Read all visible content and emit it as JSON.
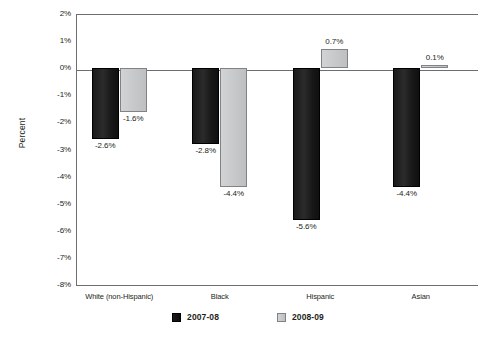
{
  "chart_data": {
    "type": "bar",
    "title": "",
    "xlabel": "",
    "ylabel": "Percent",
    "ylim": [
      -8,
      2
    ],
    "grid": false,
    "legend_position": "bottom",
    "categories": [
      "White (non-Hispanic)",
      "Black",
      "Hispanic",
      "Asian"
    ],
    "ytick_labels": [
      "2%",
      "1%",
      "0%",
      "-1%",
      "-2%",
      "-3%",
      "-4%",
      "-5%",
      "-6%",
      "-7%",
      "-8%"
    ],
    "ytick_values": [
      2,
      1,
      0,
      -1,
      -2,
      -3,
      -4,
      -5,
      -6,
      -7,
      -8
    ],
    "series": [
      {
        "name": "2007-08",
        "color": "#1a1a1a",
        "values": [
          -2.6,
          -2.8,
          -5.6,
          -4.4
        ],
        "labels": [
          "-2.6%",
          "-2.8%",
          "-5.6%",
          "-4.4%"
        ]
      },
      {
        "name": "2008-09",
        "color": "#cbcccf",
        "values": [
          -1.6,
          -4.4,
          0.7,
          0.1
        ],
        "labels": [
          "-1.6%",
          "-4.4%",
          "0.7%",
          "0.1%"
        ]
      }
    ]
  },
  "axis": {
    "y_title": "Percent"
  },
  "legend": {
    "items": [
      {
        "label": "2007-08",
        "swatch": "dark-swatch-icon"
      },
      {
        "label": "2008-09",
        "swatch": "light-swatch-icon"
      }
    ]
  }
}
